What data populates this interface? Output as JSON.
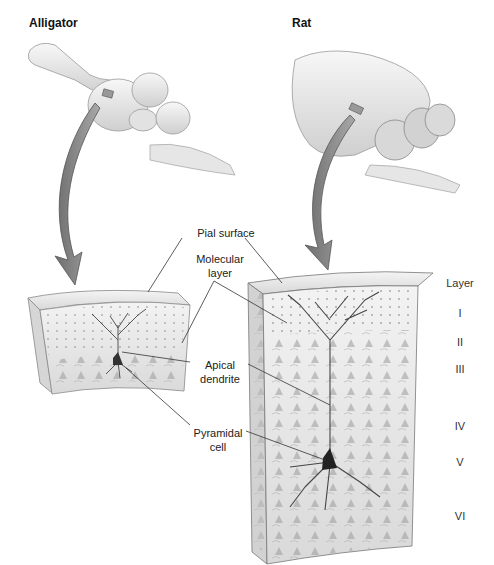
{
  "panels": {
    "left": {
      "title": "Alligator"
    },
    "right": {
      "title": "Rat"
    }
  },
  "labels": {
    "pial_surface": "Pial surface",
    "molecular_layer_1": "Molecular",
    "molecular_layer_2": "layer",
    "apical_dendrite_1": "Apical",
    "apical_dendrite_2": "dendrite",
    "pyramidal_cell_1": "Pyramidal",
    "pyramidal_cell_2": "cell"
  },
  "layers": {
    "heading": "Layer",
    "items": [
      "I",
      "II",
      "III",
      "IV",
      "V",
      "VI"
    ]
  },
  "colors": {
    "brain": "#e8e8e8",
    "arrow": "#8c8c8c",
    "tissue": "#eeeeee",
    "line": "#333333"
  }
}
